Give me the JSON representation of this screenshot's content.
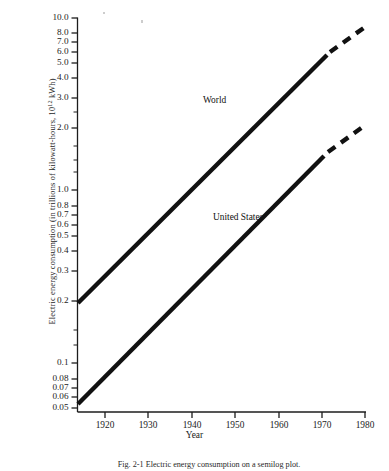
{
  "figure": {
    "y_axis_label": "Electric energy consumption (in trillions of kilowatt-hours, 10",
    "y_axis_label_exponent": "12",
    "y_axis_label_tail": " kWh)",
    "x_axis_label": "Year",
    "caption": "Fig. 2-1   Electric energy consumption on a semilog plot."
  },
  "chart_data": {
    "type": "line",
    "title": "",
    "subtitle": "",
    "xlabel": "Year",
    "ylabel": "Electric energy consumption (in trillions of kilowatt-hours, 10^12 kWh)",
    "yscale": "log",
    "xscale": "linear",
    "grid": false,
    "legend": "inline-annotations",
    "xlim": [
      1918,
      1981
    ],
    "ylim": [
      0.05,
      10.0
    ],
    "xticks": [
      1920,
      1930,
      1940,
      1950,
      1960,
      1970,
      1980
    ],
    "xtick_labels": [
      "1920",
      "1930",
      "1940",
      "1950",
      "1960",
      "1970",
      "1980"
    ],
    "yticks": [
      0.05,
      0.06,
      0.07,
      0.08,
      0.1,
      0.2,
      0.3,
      0.4,
      0.5,
      0.6,
      0.7,
      0.8,
      1.0,
      2.0,
      3.0,
      4.0,
      5.0,
      6.0,
      7.0,
      8.0,
      10.0
    ],
    "ytick_labels": [
      "0.05",
      "0.06",
      "0.07",
      "0.08",
      "0.1",
      "0.2",
      "0.3",
      "0.4",
      "0.5",
      "0.6",
      "0.7",
      "0.8",
      "1.0",
      "2.0",
      "3.0",
      "4.0",
      "5.0",
      "6.0",
      "7.0",
      "8.0",
      "10.0"
    ],
    "series": [
      {
        "name": "World",
        "label": "World",
        "style": "solid-with-dashed-extrapolation",
        "x": [
          1918,
          1975
        ],
        "y": [
          0.13,
          5.8
        ],
        "extrapolation_x": [
          1975,
          1980
        ],
        "extrapolation_y": [
          5.8,
          8.0
        ],
        "annotation": "World"
      },
      {
        "name": "United States",
        "label": "United States",
        "style": "solid-with-dashed-extrapolation",
        "x": [
          1919,
          1975
        ],
        "y": [
          0.051,
          2.1
        ],
        "extrapolation_x": [
          1975,
          1980
        ],
        "extrapolation_y": [
          2.1,
          2.9
        ],
        "annotation": "United States"
      }
    ]
  },
  "ytick_rows": [
    {
      "label": "10.0",
      "y": 18
    },
    {
      "label": "8.0",
      "y": 33
    },
    {
      "label": "7.0",
      "y": 42
    },
    {
      "label": "6.0",
      "y": 52
    },
    {
      "label": "5.0",
      "y": 63
    },
    {
      "label": "4.0",
      "y": 78
    },
    {
      "label": "3.0",
      "y": 98
    },
    {
      "label": "2.0",
      "y": 128
    },
    {
      "label": "1.0",
      "y": 190
    },
    {
      "label": "0.8",
      "y": 206
    },
    {
      "label": "0.7",
      "y": 215
    },
    {
      "label": "0.6",
      "y": 225
    },
    {
      "label": "0.5",
      "y": 236
    },
    {
      "label": "0.4",
      "y": 251
    },
    {
      "label": "0.3",
      "y": 271
    },
    {
      "label": "0.2",
      "y": 301
    },
    {
      "label": "0.1",
      "y": 363
    },
    {
      "label": "0.08",
      "y": 379
    },
    {
      "label": "0.07",
      "y": 388
    },
    {
      "label": "0.06",
      "y": 397
    },
    {
      "label": "0.05",
      "y": 408
    }
  ],
  "xtick_cols": [
    {
      "label": "1920",
      "x": 105
    },
    {
      "label": "1930",
      "x": 148
    },
    {
      "label": "1940",
      "x": 192
    },
    {
      "label": "1950",
      "x": 235
    },
    {
      "label": "1960",
      "x": 279
    },
    {
      "label": "1970",
      "x": 322
    },
    {
      "label": "1980",
      "x": 365
    }
  ],
  "series_labels": {
    "world": "World",
    "united_states": "United States"
  }
}
